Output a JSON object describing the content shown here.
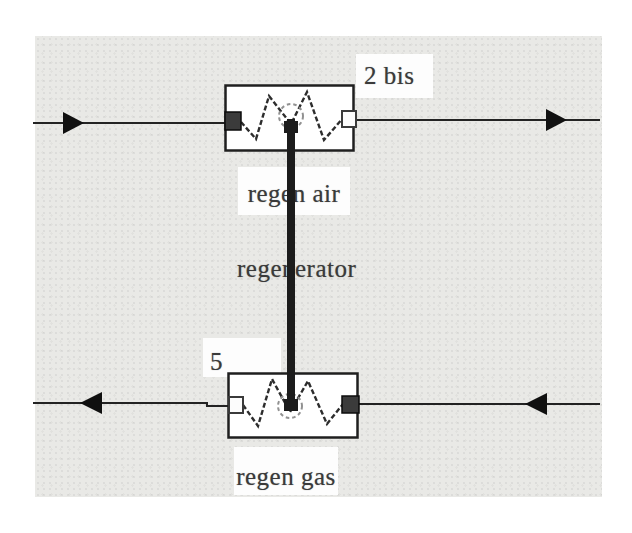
{
  "colors": {
    "canvas-bg": "#e9e9e6",
    "line": "#232323",
    "block-fill": "#ffffff",
    "port-dark": "#3b3b3b",
    "text": "#3a3a3a",
    "plate-bg": "#fdfdfd",
    "connector": "#1c1c1c",
    "node-stroke": "#919191"
  },
  "flowsheet": {
    "units": [
      {
        "id": "regen-air-exchanger",
        "label": "regen air",
        "stream_label": "2 bis",
        "flow_direction": "left-to-right"
      },
      {
        "id": "regen-gas-exchanger",
        "label": "regen gas",
        "stream_label": "5",
        "flow_direction": "right-to-left"
      }
    ],
    "connector": {
      "label": "regenerator"
    }
  }
}
